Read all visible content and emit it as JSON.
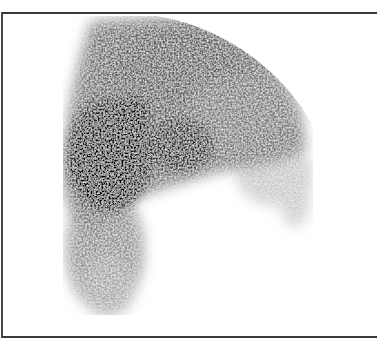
{
  "image": {
    "kind": "scintigraphy-scan",
    "frame": {
      "border_color": "#3a3a3a",
      "background": "#ffffff"
    },
    "palette": {
      "hot": "#000000",
      "mid": "#555555",
      "low": "#9a9a9a",
      "background": "#ffffff"
    },
    "regions": [
      {
        "name": "upper-dome",
        "description": "large gray dome with sharp circular top-right edge"
      },
      {
        "name": "dark-hotspot-left",
        "description": "dense black focal uptake on left"
      },
      {
        "name": "dark-hotspot-center",
        "description": "secondary dark area center"
      },
      {
        "name": "descending-tail",
        "description": "gray tail extending downward on left"
      },
      {
        "name": "right-fringe",
        "description": "faint speckled extension at lower right"
      }
    ]
  }
}
